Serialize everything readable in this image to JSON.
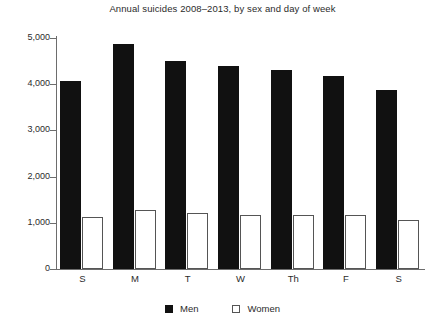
{
  "chart_data": {
    "type": "bar",
    "title": "Annual suicides 2008–2013, by sex and day of week",
    "xlabel": "",
    "ylabel": "",
    "categories": [
      "S",
      "M",
      "T",
      "W",
      "Th",
      "F",
      "S"
    ],
    "series": [
      {
        "name": "Men",
        "color": "#111111",
        "values": [
          4070,
          4870,
          4500,
          4390,
          4310,
          4180,
          3870
        ]
      },
      {
        "name": "Women",
        "color": "#ffffff",
        "values": [
          1130,
          1280,
          1210,
          1170,
          1170,
          1170,
          1060
        ]
      }
    ],
    "ylim": [
      0,
      5000
    ],
    "yticks": [
      0,
      1000,
      2000,
      3000,
      4000,
      5000
    ],
    "ytick_labels": [
      "0",
      "1,000",
      "2,000",
      "3,000",
      "4,000",
      "5,000"
    ],
    "grid": false,
    "legend_position": "bottom-center"
  },
  "legend": {
    "items": [
      {
        "label": "Men",
        "marker": "filled-square"
      },
      {
        "label": "Women",
        "marker": "open-square"
      }
    ]
  }
}
